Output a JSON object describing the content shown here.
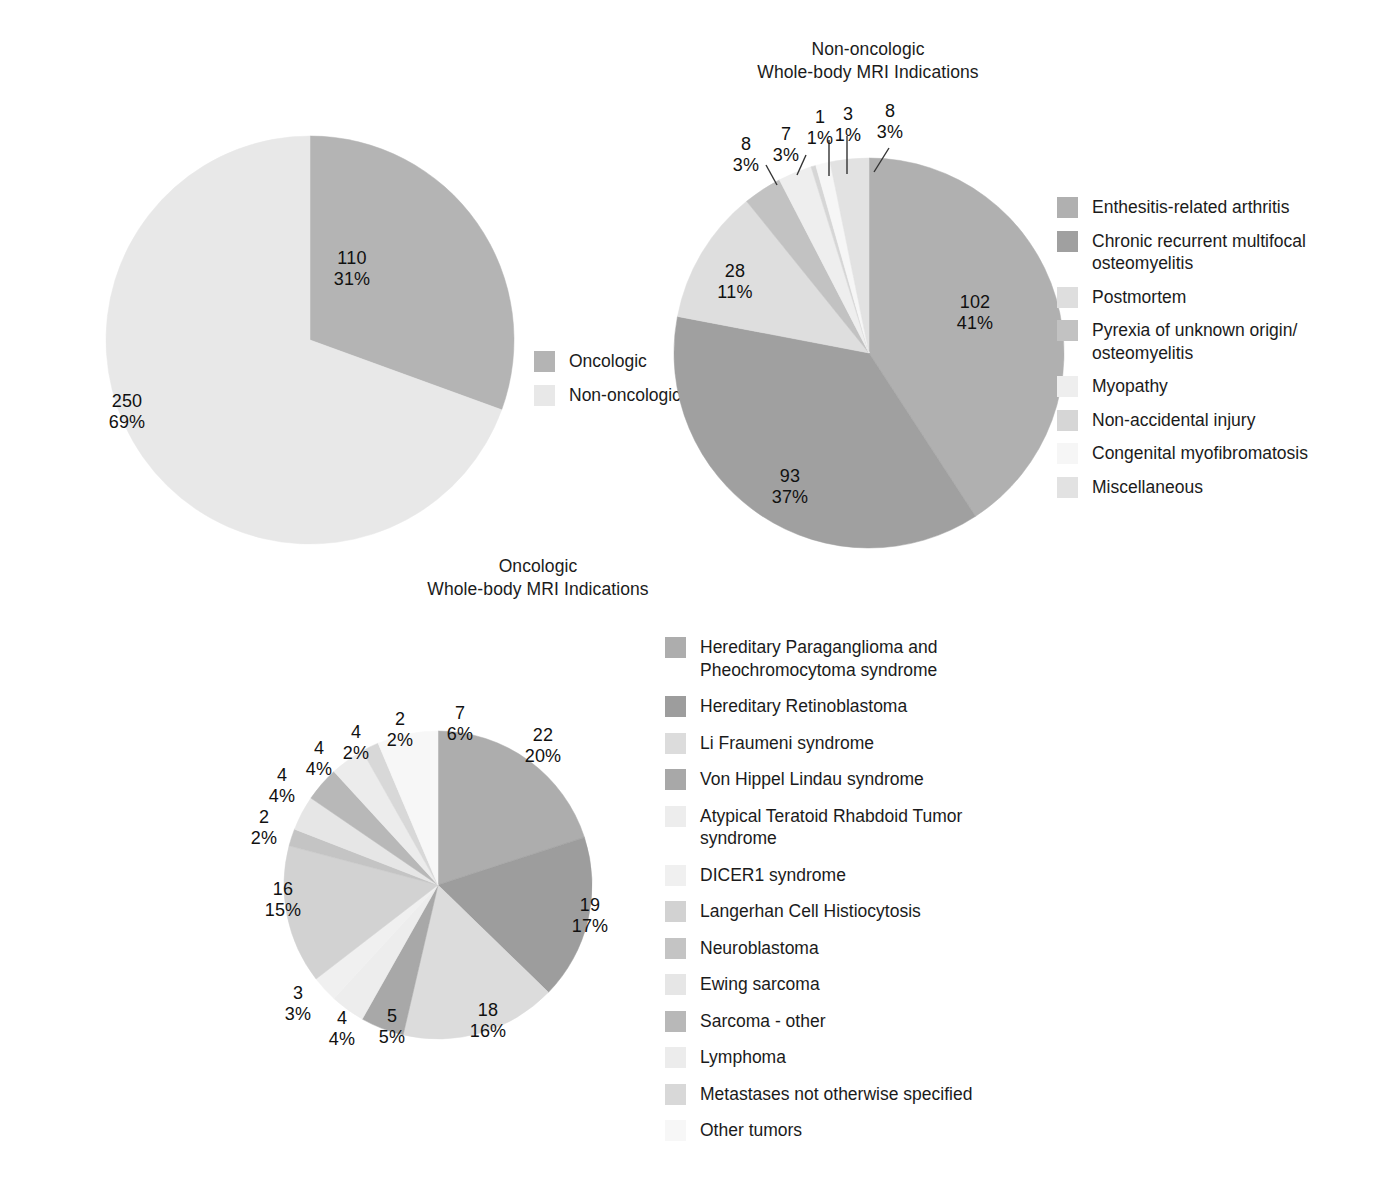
{
  "figure": {
    "background": "#ffffff",
    "text_color": "#1a1a1a"
  },
  "chart_data": [
    {
      "type": "pie",
      "id": "overall-indications",
      "title": "",
      "categories": [
        "Oncologic",
        "Non-oncologic"
      ],
      "values": [
        110,
        250
      ],
      "percents": [
        "31%",
        "69%"
      ],
      "labels": [
        "110\n31%",
        "250\n69%"
      ],
      "colors": [
        "#b4b4b4",
        "#e8e8e8"
      ],
      "legend_position": "right",
      "total": 360
    },
    {
      "type": "pie",
      "id": "non-oncologic-indications",
      "title": "Non-oncologic\nWhole-body MRI Indications",
      "categories": [
        "Enthesitis-related arthritis",
        "Chronic recurrent multifocal\nosteomyelitis",
        "Postmortem",
        "Pyrexia of unknown origin/\nosteomyelitis",
        "Myopathy",
        "Non-accidental injury",
        "Congenital myofibromatosis",
        "Miscellaneous"
      ],
      "values": [
        102,
        93,
        28,
        8,
        7,
        1,
        3,
        8
      ],
      "percents": [
        "41%",
        "37%",
        "11%",
        "3%",
        "3%",
        "1%",
        "1%",
        "3%"
      ],
      "colors": [
        "#b0b0b0",
        "#a0a0a0",
        "#dedede",
        "#c2c2c2",
        "#eeeeee",
        "#d6d6d6",
        "#f6f6f6",
        "#e2e2e2"
      ],
      "legend_position": "right",
      "total": 250
    },
    {
      "type": "pie",
      "id": "oncologic-indications",
      "title": "Oncologic\nWhole-body MRI Indications",
      "categories": [
        "Hereditary Paraganglioma and\nPheochromocytoma syndrome",
        "Hereditary Retinoblastoma",
        "Li Fraumeni syndrome",
        "Von Hippel Lindau syndrome",
        "Atypical Teratoid Rhabdoid Tumor\nsyndrome",
        "DICER1 syndrome",
        "Langerhan Cell Histiocytosis",
        "Neuroblastoma",
        "Ewing sarcoma",
        "Sarcoma - other",
        "Lymphoma",
        "Metastases not otherwise specified",
        "Other tumors"
      ],
      "values": [
        22,
        19,
        18,
        5,
        4,
        3,
        16,
        2,
        4,
        4,
        4,
        2,
        7
      ],
      "percents": [
        "20%",
        "17%",
        "16%",
        "5%",
        "4%",
        "3%",
        "15%",
        "2%",
        "4%",
        "4%",
        "2%",
        "2%",
        "6%"
      ],
      "colors": [
        "#adadad",
        "#9d9d9d",
        "#dcdcdc",
        "#a8a8a8",
        "#ededed",
        "#f0f0f0",
        "#d2d2d2",
        "#c4c4c4",
        "#e6e6e6",
        "#b8b8b8",
        "#ececec",
        "#d8d8d8",
        "#f7f7f7"
      ],
      "legend_position": "right",
      "total": 110
    }
  ],
  "charts": {
    "one": {
      "legend": [
        {
          "label": "Oncologic",
          "color": "#b4b4b4"
        },
        {
          "label": "Non-oncologic",
          "color": "#e8e8e8"
        }
      ],
      "labels": [
        {
          "text": "110\n31%"
        },
        {
          "text": "250\n69%"
        }
      ]
    },
    "two": {
      "title": "Non-oncologic\nWhole-body MRI Indications",
      "legend": [
        {
          "label": "Enthesitis-related arthritis",
          "color": "#b0b0b0"
        },
        {
          "label": "Chronic recurrent multifocal\nosteomyelitis",
          "color": "#a0a0a0"
        },
        {
          "label": "Postmortem",
          "color": "#dedede"
        },
        {
          "label": "Pyrexia of unknown origin/\nosteomyelitis",
          "color": "#c2c2c2"
        },
        {
          "label": "Myopathy",
          "color": "#eeeeee"
        },
        {
          "label": "Non-accidental injury",
          "color": "#d6d6d6"
        },
        {
          "label": "Congenital myofibromatosis",
          "color": "#f6f6f6"
        },
        {
          "label": "Miscellaneous",
          "color": "#e2e2e2"
        }
      ],
      "labels": [
        {
          "text": "102\n41%"
        },
        {
          "text": "93\n37%"
        },
        {
          "text": "28\n11%"
        },
        {
          "text": "8\n3%"
        },
        {
          "text": "7\n3%"
        },
        {
          "text": "1\n1%"
        },
        {
          "text": "3\n1%"
        },
        {
          "text": "8\n3%"
        }
      ]
    },
    "three": {
      "title": "Oncologic\nWhole-body MRI Indications",
      "legend": [
        {
          "label": "Hereditary Paraganglioma and\nPheochromocytoma syndrome",
          "color": "#adadad"
        },
        {
          "label": "Hereditary Retinoblastoma",
          "color": "#9d9d9d"
        },
        {
          "label": "Li Fraumeni syndrome",
          "color": "#dcdcdc"
        },
        {
          "label": "Von Hippel Lindau syndrome",
          "color": "#a8a8a8"
        },
        {
          "label": "Atypical Teratoid Rhabdoid Tumor\nsyndrome",
          "color": "#ededed"
        },
        {
          "label": "DICER1 syndrome",
          "color": "#f0f0f0"
        },
        {
          "label": "Langerhan Cell Histiocytosis",
          "color": "#d2d2d2"
        },
        {
          "label": "Neuroblastoma",
          "color": "#c4c4c4"
        },
        {
          "label": "Ewing sarcoma",
          "color": "#e6e6e6"
        },
        {
          "label": "Sarcoma - other",
          "color": "#b8b8b8"
        },
        {
          "label": "Lymphoma",
          "color": "#ececec"
        },
        {
          "label": "Metastases not otherwise specified",
          "color": "#d8d8d8"
        },
        {
          "label": "Other tumors",
          "color": "#f7f7f7"
        }
      ],
      "labels": [
        {
          "text": "22\n20%"
        },
        {
          "text": "19\n17%"
        },
        {
          "text": "18\n16%"
        },
        {
          "text": "5\n5%"
        },
        {
          "text": "4\n4%"
        },
        {
          "text": "3\n3%"
        },
        {
          "text": "16\n15%"
        },
        {
          "text": "2\n2%"
        },
        {
          "text": "4\n4%"
        },
        {
          "text": "4\n4%"
        },
        {
          "text": "4\n2%"
        },
        {
          "text": "2\n2%"
        },
        {
          "text": "7\n6%"
        }
      ]
    }
  }
}
